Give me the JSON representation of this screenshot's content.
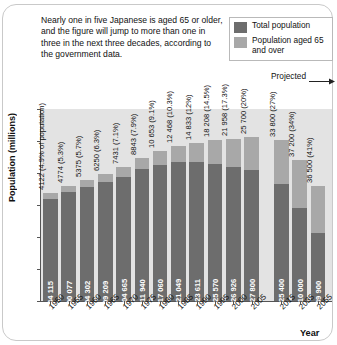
{
  "intro_text": "Nearly one in five Japanese is aged 65 or older, and the figure will jump to more than one in three in the next three decades, according to the government data.",
  "legend": {
    "position": "top-right",
    "items": [
      {
        "label": "Total population",
        "color": "#6d6d6d",
        "icon": "legend-swatch"
      },
      {
        "label": "Population aged 65 and over",
        "color": "#a8a8a8",
        "icon": "legend-swatch"
      }
    ]
  },
  "annotations": {
    "projected": "Projected",
    "projected_arrow": "arrow-right-icon"
  },
  "axes": {
    "ylabel": "Population (millions)",
    "xlabel": "Year",
    "yticks": [
      "150",
      "125",
      "100",
      "75",
      "50",
      "25",
      "0"
    ]
  },
  "chart_data": {
    "type": "bar",
    "title": "",
    "subtitle": "",
    "xlabel": "Year",
    "ylabel": "Population (millions)",
    "ylim": [
      0,
      150
    ],
    "grid": false,
    "legend_position": "top-right",
    "stacked": true,
    "categories": [
      "1950",
      "1955",
      "1960",
      "1965",
      "1970",
      "1975",
      "1980",
      "1985",
      "1990",
      "1995",
      "2000",
      "2005",
      "2015",
      "2035",
      "2055"
    ],
    "series": [
      {
        "name": "Total population",
        "color": "#6d6d6d",
        "unit": "thousands",
        "values": [
          84115,
          90077,
          94302,
          99209,
          104665,
          111940,
          117060,
          121049,
          123611,
          125570,
          126926,
          127800,
          125400,
          110000,
          89900
        ],
        "labels": [
          "84 115",
          "90 077",
          "94 302",
          "99 209",
          "104 665",
          "111 940",
          "117 060",
          "121 049",
          "123 611",
          "125 570",
          "126 926",
          "127 800",
          "125 400",
          "110 000",
          "89 900"
        ]
      },
      {
        "name": "Population aged 65 and over",
        "color": "#a8a8a8",
        "unit": "thousands",
        "values": [
          4122,
          4774,
          5375,
          6250,
          7431,
          8843,
          10653,
          12468,
          14833,
          18208,
          21958,
          25700,
          33800,
          37200,
          36500
        ],
        "percent": [
          4.9,
          5.3,
          5.7,
          6.3,
          7.1,
          7.9,
          9.1,
          10.3,
          12.0,
          14.5,
          17.3,
          20.0,
          27.0,
          34.0,
          41.0
        ],
        "labels": [
          "4122 (4.9% of population)",
          "4774 (5.3%)",
          "5375 (5.7%)",
          "6250 (6.3%)",
          "7431 (7.1%)",
          "8843 (7.9%)",
          "10 653 (9.1%)",
          "12 468 (10.3%)",
          "14 833 (12%)",
          "18 208 (14.5%)",
          "21 958 (17.3%)",
          "25 700 (20%)",
          "33 800 (27%)",
          "37 200 (34%)",
          "36 500 (41%)"
        ]
      }
    ],
    "projected_from": "2015",
    "annotation": "Projected"
  }
}
